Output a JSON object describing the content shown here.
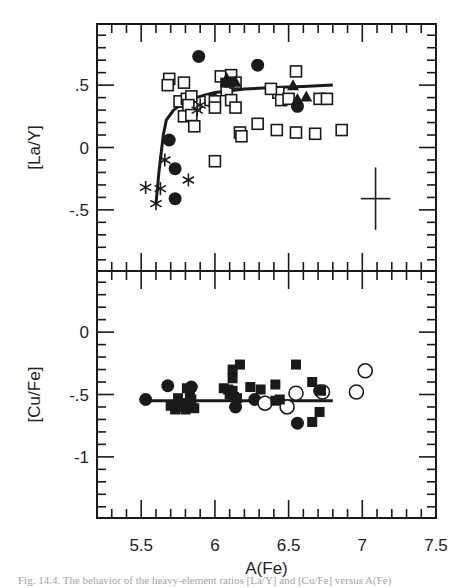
{
  "figure": {
    "caption": "Fig. 14.4. The behavior of the heavy-element ratios [La/Y] and [Cu/Fe] versus A(Fe)",
    "xlabel": "A(Fe)"
  },
  "chart_data": [
    {
      "type": "scatter",
      "panel": "top",
      "ylabel": "[La/Y]",
      "xlabel": "A(Fe)",
      "xlim": [
        5.2,
        7.5
      ],
      "ylim": [
        -0.99,
        0.99
      ],
      "xticks": [
        5.5,
        6,
        6.5,
        7,
        7.5
      ],
      "yticks": [
        {
          "v": 0.5,
          "label": ".5"
        },
        {
          "v": 0,
          "label": "0"
        },
        {
          "v": -0.5,
          "label": "-.5"
        }
      ],
      "grid": false,
      "error_bar": {
        "x": 7.09,
        "y": -0.41,
        "dx": 0.1,
        "dy": 0.25
      },
      "fit_curve": [
        [
          5.6,
          -0.45
        ],
        [
          5.62,
          -0.2
        ],
        [
          5.65,
          0.1
        ],
        [
          5.67,
          0.22
        ],
        [
          5.72,
          0.3
        ],
        [
          5.8,
          0.37
        ],
        [
          5.9,
          0.41
        ],
        [
          6.0,
          0.44
        ],
        [
          6.2,
          0.47
        ],
        [
          6.4,
          0.48
        ],
        [
          6.6,
          0.49
        ],
        [
          6.8,
          0.5
        ]
      ],
      "series": [
        {
          "name": "open squares",
          "marker": "square-open",
          "points": [
            [
              5.69,
              0.55
            ],
            [
              5.68,
              0.5
            ],
            [
              5.79,
              0.52
            ],
            [
              5.8,
              0.37
            ],
            [
              5.76,
              0.37
            ],
            [
              5.81,
              0.39
            ],
            [
              5.84,
              0.41
            ],
            [
              5.82,
              0.34
            ],
            [
              5.79,
              0.25
            ],
            [
              5.84,
              0.26
            ],
            [
              5.86,
              0.17
            ],
            [
              5.97,
              0.38
            ],
            [
              6.0,
              0.37
            ],
            [
              6.0,
              0.32
            ],
            [
              6.04,
              0.57
            ],
            [
              6.08,
              0.46
            ],
            [
              6.11,
              0.58
            ],
            [
              6.14,
              0.52
            ],
            [
              6.11,
              0.38
            ],
            [
              6.14,
              0.32
            ],
            [
              6.17,
              0.12
            ],
            [
              6.18,
              0.09
            ],
            [
              6.0,
              -0.11
            ],
            [
              6.29,
              0.19
            ],
            [
              6.43,
              0.44
            ],
            [
              6.45,
              0.38
            ],
            [
              6.5,
              0.39
            ],
            [
              6.55,
              0.61
            ],
            [
              6.71,
              0.39
            ],
            [
              6.76,
              0.39
            ],
            [
              6.42,
              0.14
            ],
            [
              6.55,
              0.12
            ],
            [
              6.68,
              0.11
            ],
            [
              6.86,
              0.14
            ],
            [
              6.38,
              0.47
            ]
          ]
        },
        {
          "name": "filled circles",
          "marker": "circle-filled",
          "points": [
            [
              5.89,
              0.73
            ],
            [
              6.29,
              0.66
            ],
            [
              5.69,
              0.06
            ],
            [
              5.73,
              -0.17
            ],
            [
              5.73,
              -0.41
            ],
            [
              6.56,
              0.33
            ]
          ]
        },
        {
          "name": "filled triangles",
          "marker": "triangle-filled",
          "points": [
            [
              6.08,
              0.55
            ],
            [
              6.14,
              0.52
            ],
            [
              6.53,
              0.49
            ],
            [
              6.62,
              0.4
            ],
            [
              6.56,
              0.38
            ]
          ]
        },
        {
          "name": "asterisks",
          "marker": "asterisk",
          "points": [
            [
              5.53,
              -0.32
            ],
            [
              5.6,
              -0.45
            ],
            [
              5.63,
              -0.33
            ],
            [
              5.66,
              -0.1
            ],
            [
              5.82,
              -0.26
            ],
            [
              5.88,
              0.3
            ],
            [
              5.9,
              0.34
            ]
          ]
        },
        {
          "name": "filled squares",
          "marker": "square-filled",
          "points": [
            [
              6.07,
              0.52
            ],
            [
              6.1,
              0.52
            ]
          ]
        }
      ]
    },
    {
      "type": "scatter",
      "panel": "bottom",
      "ylabel": "[Cu/Fe]",
      "xlabel": "A(Fe)",
      "xlim": [
        5.2,
        7.5
      ],
      "ylim": [
        -1.49,
        0.49
      ],
      "xticks": [
        5.5,
        6,
        6.5,
        7,
        7.5
      ],
      "yticks": [
        {
          "v": 0,
          "label": "0"
        },
        {
          "v": -0.5,
          "label": "-.5"
        },
        {
          "v": -1,
          "label": "-1"
        }
      ],
      "grid": false,
      "fit_line": [
        [
          5.53,
          -0.55
        ],
        [
          6.8,
          -0.55
        ]
      ],
      "series": [
        {
          "name": "filled circles",
          "marker": "circle-filled",
          "points": [
            [
              5.53,
              -0.54
            ],
            [
              5.68,
              -0.43
            ],
            [
              5.84,
              -0.44
            ],
            [
              6.14,
              -0.6
            ],
            [
              6.27,
              -0.54
            ],
            [
              6.56,
              -0.73
            ],
            [
              6.71,
              -0.47
            ],
            [
              5.75,
              -0.58
            ]
          ]
        },
        {
          "name": "open circles",
          "marker": "circle-open",
          "points": [
            [
              6.34,
              -0.57
            ],
            [
              6.49,
              -0.6
            ],
            [
              6.55,
              -0.49
            ],
            [
              6.73,
              -0.48
            ],
            [
              6.96,
              -0.48
            ],
            [
              7.02,
              -0.31
            ]
          ]
        },
        {
          "name": "filled squares",
          "marker": "square-filled",
          "points": [
            [
              5.7,
              -0.59
            ],
            [
              5.73,
              -0.62
            ],
            [
              5.76,
              -0.57
            ],
            [
              5.78,
              -0.6
            ],
            [
              5.8,
              -0.62
            ],
            [
              5.82,
              -0.57
            ],
            [
              5.81,
              -0.45
            ],
            [
              5.83,
              -0.5
            ],
            [
              5.84,
              -0.54
            ],
            [
              5.86,
              -0.61
            ],
            [
              5.75,
              -0.53
            ],
            [
              6.06,
              -0.45
            ],
            [
              6.09,
              -0.46
            ],
            [
              6.1,
              -0.5
            ],
            [
              6.12,
              -0.47
            ],
            [
              6.13,
              -0.52
            ],
            [
              6.15,
              -0.53
            ],
            [
              6.12,
              -0.37
            ],
            [
              6.12,
              -0.3
            ],
            [
              6.17,
              -0.26
            ],
            [
              6.31,
              -0.46
            ],
            [
              6.24,
              -0.44
            ],
            [
              6.41,
              -0.42
            ],
            [
              6.41,
              -0.55
            ],
            [
              6.55,
              -0.26
            ],
            [
              6.66,
              -0.4
            ],
            [
              6.71,
              -0.64
            ],
            [
              6.66,
              -0.72
            ],
            [
              6.44,
              -0.54
            ],
            [
              6.72,
              -0.47
            ]
          ]
        }
      ]
    }
  ]
}
